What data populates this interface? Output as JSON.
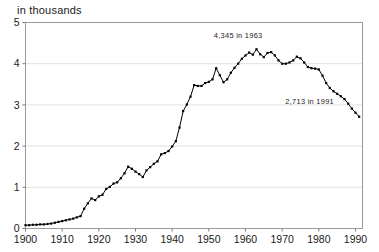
{
  "chart_data": {
    "type": "line",
    "title": "in thousands",
    "subtitle": "",
    "xlabel": "",
    "ylabel": "",
    "xlim": [
      1900,
      1991
    ],
    "ylim": [
      0,
      5
    ],
    "grid": true,
    "grid_orientation": "horizontal",
    "legend": false,
    "legend_position": "none",
    "marker": "square",
    "line_color": "#000000",
    "x_ticks": [
      1900,
      1910,
      1920,
      1930,
      1940,
      1950,
      1960,
      1970,
      1980,
      1990
    ],
    "x_tick_labels": [
      "1900",
      "1910",
      "1920",
      "1930",
      "1940",
      "1950",
      "1960",
      "1970",
      "1980",
      "1990"
    ],
    "y_ticks": [
      0,
      1,
      2,
      3,
      4,
      5
    ],
    "y_tick_labels": [
      "0",
      "1",
      "2",
      "3",
      "4",
      "5"
    ],
    "annotations": [
      {
        "text": "4,345 in 1963",
        "x": 1958.0,
        "y": 4.62
      },
      {
        "text": "2,713 in 1991",
        "x": 1977.5,
        "y": 3.02
      }
    ],
    "x": [
      1900,
      1901,
      1902,
      1903,
      1904,
      1905,
      1906,
      1907,
      1908,
      1909,
      1910,
      1911,
      1912,
      1913,
      1914,
      1915,
      1916,
      1917,
      1918,
      1919,
      1920,
      1921,
      1922,
      1923,
      1924,
      1925,
      1926,
      1927,
      1928,
      1929,
      1930,
      1931,
      1932,
      1933,
      1934,
      1935,
      1936,
      1937,
      1938,
      1939,
      1940,
      1941,
      1942,
      1943,
      1944,
      1945,
      1946,
      1947,
      1948,
      1949,
      1950,
      1951,
      1952,
      1953,
      1954,
      1955,
      1956,
      1957,
      1958,
      1959,
      1960,
      1961,
      1962,
      1963,
      1964,
      1965,
      1966,
      1967,
      1968,
      1969,
      1970,
      1971,
      1972,
      1973,
      1974,
      1975,
      1976,
      1977,
      1978,
      1979,
      1980,
      1981,
      1982,
      1983,
      1984,
      1985,
      1986,
      1987,
      1988,
      1989,
      1990,
      1991
    ],
    "values": [
      0.08,
      0.08,
      0.09,
      0.09,
      0.1,
      0.1,
      0.11,
      0.12,
      0.14,
      0.16,
      0.18,
      0.2,
      0.22,
      0.24,
      0.27,
      0.3,
      0.48,
      0.61,
      0.73,
      0.69,
      0.78,
      0.82,
      0.96,
      1.01,
      1.09,
      1.12,
      1.22,
      1.34,
      1.5,
      1.45,
      1.38,
      1.32,
      1.25,
      1.41,
      1.49,
      1.57,
      1.63,
      1.8,
      1.83,
      1.88,
      1.99,
      2.12,
      2.45,
      2.85,
      3.01,
      3.2,
      3.48,
      3.46,
      3.46,
      3.53,
      3.56,
      3.62,
      3.89,
      3.72,
      3.55,
      3.62,
      3.78,
      3.9,
      4.0,
      4.12,
      4.2,
      4.27,
      4.22,
      4.35,
      4.23,
      4.16,
      4.26,
      4.28,
      4.2,
      4.08,
      4.0,
      4.0,
      4.03,
      4.08,
      4.17,
      4.13,
      4.03,
      3.92,
      3.89,
      3.88,
      3.86,
      3.71,
      3.53,
      3.41,
      3.33,
      3.27,
      3.21,
      3.14,
      3.03,
      2.91,
      2.81,
      2.713
    ]
  }
}
